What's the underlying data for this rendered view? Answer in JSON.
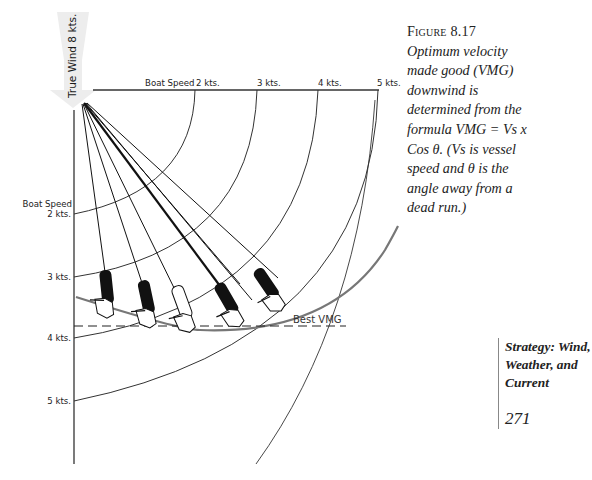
{
  "figure": {
    "wind_label": "True Wind 8 kts.",
    "top_axis": {
      "title": "Boat Speed",
      "ticks": [
        "2 kts.",
        "3 kts.",
        "4 kts.",
        "5 kts."
      ]
    },
    "left_axis": {
      "title": "Boat Speed",
      "ticks": [
        "2 kts.",
        "3 kts.",
        "4 kts.",
        "5 kts."
      ]
    },
    "best_vmg_label": "Best VMG",
    "boats": [
      {
        "id": 1,
        "fill": "black"
      },
      {
        "id": 2,
        "fill": "black"
      },
      {
        "id": 3,
        "fill": "white"
      },
      {
        "id": 4,
        "fill": "black"
      },
      {
        "id": 5,
        "fill": "black"
      }
    ]
  },
  "caption": {
    "label": "Figure 8.17",
    "text": "Optimum velocity made good (VMG) downwind is determined from the formula VMG = Vs x Cos θ. (Vs is vessel speed and θ is the angle away from a dead run.)"
  },
  "margin": {
    "running_head": "Strategy: Wind, Weather, and Current",
    "page_number": "271"
  },
  "colors": {
    "ink": "#1a1a1a",
    "arrow_gray": "#ececec",
    "polar_curve": "#777777"
  }
}
